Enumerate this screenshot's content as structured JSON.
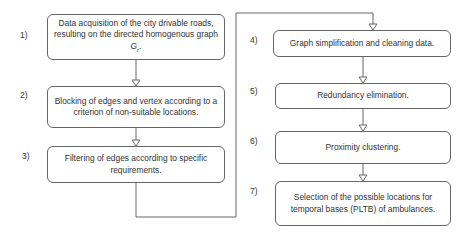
{
  "steps": [
    {
      "num": "1)",
      "text": "Data acquisition of the city drivable roads, resulting on the directed homogenous graph",
      "symbol": "G",
      "subscript": "r",
      "suffix": "."
    },
    {
      "num": "2)",
      "text": "Blocking of edges and vertex according to a criterion of non-suitable locations."
    },
    {
      "num": "3)",
      "text": "Filtering of edges according to specific requirements."
    },
    {
      "num": "4)",
      "text": "Graph simplification and cleaning data."
    },
    {
      "num": "5)",
      "text": "Redundancy elimination."
    },
    {
      "num": "6)",
      "text": "Proximity clustering."
    },
    {
      "num": "7)",
      "text": "Selection of the possible locations for temporal bases (PLTB) of ambulances."
    }
  ],
  "colors": {
    "line": "#666666",
    "text": "#333333",
    "background": "#ffffff"
  }
}
